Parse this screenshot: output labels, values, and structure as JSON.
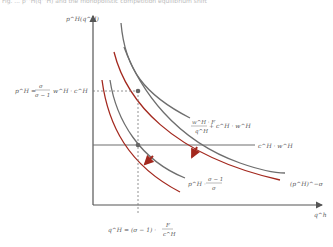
{
  "caption": "Fig. ... p^H(q^H) and the monopolistic competition equilibrium shift",
  "axes": {
    "y_label": "p^H(q^H)",
    "x_label": "q^h"
  },
  "labels": {
    "price_eq": "p^H = σ/(σ−1) · w^H · c^H",
    "price_eq_parts": {
      "lhs": "p^H =",
      "num": "σ",
      "den": "σ − 1",
      "rhs": "w^H · c^H"
    },
    "avg_cost": {
      "num": "w^H · F",
      "den": "q^H",
      "rhs": "+ c^H · w^H"
    },
    "mc_line": "c^H · w^H",
    "mr_curve": {
      "lhs": "p^H ·",
      "num": "σ − 1",
      "den": "σ"
    },
    "demand_curve": "(p^H)^−σ",
    "quantity_eq": {
      "lhs": "q^H = (σ − 1) ·",
      "num": "F",
      "den": "c^H"
    }
  },
  "colors": {
    "gray_curve": "#6e6e6e",
    "red_curve": "#a3281e",
    "axis": "#555555",
    "arrow": "#a3281e",
    "dot": "#666666"
  }
}
